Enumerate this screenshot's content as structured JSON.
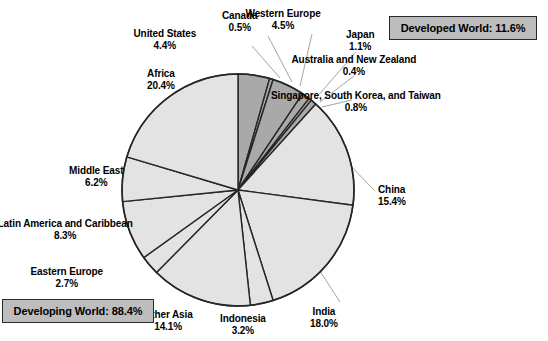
{
  "chart_data": {
    "type": "pie",
    "title": "",
    "subtitle": "",
    "xlabel": "",
    "ylabel": "",
    "legend_position": "none",
    "grid": false,
    "units": "percent",
    "start_angle_deg": 0,
    "direction": "clockwise",
    "total": 100.0,
    "categories": [
      "United States",
      "Canada",
      "Western Europe",
      "Japan",
      "Australia and New Zealand",
      "Singapore, South Korea, and Taiwan",
      "China",
      "India",
      "Indonesia",
      "Other Asia",
      "Eastern Europe",
      "Latin America and Caribbean",
      "Middle East",
      "Africa"
    ],
    "values": [
      4.4,
      0.5,
      4.5,
      1.1,
      0.4,
      0.8,
      15.4,
      18.0,
      3.2,
      14.1,
      2.7,
      8.3,
      6.2,
      20.4
    ],
    "value_labels": [
      "4.4%",
      "0.5%",
      "4.5%",
      "1.1%",
      "0.4%",
      "0.8%",
      "15.4%",
      "18.0%",
      "3.2%",
      "14.1%",
      "2.7%",
      "8.3%",
      "6.2%",
      "20.4%"
    ],
    "groups": [
      "developed",
      "developed",
      "developed",
      "developed",
      "developed",
      "developed",
      "developing",
      "developing",
      "developing",
      "developing",
      "developing",
      "developing",
      "developing",
      "developing"
    ],
    "group_totals": {
      "developed": 11.6,
      "developing": 88.4
    },
    "colors": {
      "developed": "#a9a9a9",
      "developing": "#e3e3e3",
      "slice_border": "#262626",
      "pie_outline": "#262626",
      "leader_line": "#9a9a9a",
      "badge_fill": "#bdbdbd",
      "badge_border": "#2a2a2a",
      "text": "#000000",
      "background": "#ffffff"
    }
  },
  "geometry": {
    "cx": 238,
    "cy": 190,
    "r": 116
  },
  "slices": [
    {
      "name": "United States",
      "value": "4.4%",
      "group": "developed",
      "label_x": 165,
      "label_y": 28,
      "align": "ctr",
      "leader": {
        "x1": 252,
        "y1": 46,
        "x2": 280,
        "y2": 78
      }
    },
    {
      "name": "Canada",
      "value": "0.5%",
      "group": "developed",
      "label_x": 240,
      "label_y": 10,
      "align": "ctr",
      "leader": {
        "x1": 268,
        "y1": 36,
        "x2": 292,
        "y2": 82
      }
    },
    {
      "name": "Western Europe",
      "value": "4.5%",
      "group": "developed",
      "label_x": 283,
      "label_y": 8,
      "align": "ctr",
      "leader": {
        "x1": 312,
        "y1": 34,
        "x2": 300,
        "y2": 86
      }
    },
    {
      "name": "Japan",
      "value": "1.1%",
      "group": "developed",
      "label_x": 360,
      "label_y": 29,
      "align": "ctr",
      "leader": {
        "x1": 356,
        "y1": 52,
        "x2": 316,
        "y2": 98
      }
    },
    {
      "name": "Australia and New Zealand",
      "value": "0.4%",
      "group": "developed",
      "label_x": 354,
      "label_y": 54,
      "align": "ctr",
      "leader": {
        "x1": 354,
        "y1": 76,
        "x2": 320,
        "y2": 102
      }
    },
    {
      "name": "Singapore, South Korea, and Taiwan",
      "value": "0.8%",
      "group": "developed",
      "label_x": 356,
      "label_y": 90,
      "align": "ctr",
      "leader": {
        "x1": 352,
        "y1": 100,
        "x2": 322,
        "y2": 107
      }
    },
    {
      "name": "China",
      "value": "15.4%",
      "group": "developing",
      "label_x": 378,
      "label_y": 184,
      "align": "lft",
      "leader": {
        "x1": 374,
        "y1": 190,
        "x2": 345,
        "y2": 160
      }
    },
    {
      "name": "India",
      "value": "18.0%",
      "group": "developing",
      "label_x": 324,
      "label_y": 306,
      "align": "ctr",
      "leader": {
        "x1": 340,
        "y1": 302,
        "x2": 318,
        "y2": 268
      }
    },
    {
      "name": "Indonesia",
      "value": "3.2%",
      "group": "developing",
      "label_x": 243,
      "label_y": 313,
      "align": "ctr",
      "leader": null
    },
    {
      "name": "Other Asia",
      "value": "14.1%",
      "group": "developing",
      "label_x": 168,
      "label_y": 309,
      "align": "ctr",
      "leader": null
    },
    {
      "name": "Eastern Europe",
      "value": "2.7%",
      "group": "developing",
      "label_x": 67,
      "label_y": 266,
      "align": "ctr",
      "leader": null
    },
    {
      "name": "Latin America and Caribbean",
      "value": "8.3%",
      "group": "developing",
      "label_x": 65,
      "label_y": 218,
      "align": "ctr",
      "leader": null
    },
    {
      "name": "Middle East",
      "value": "6.2%",
      "group": "developing",
      "label_x": 96,
      "label_y": 165,
      "align": "ctr",
      "leader": null
    },
    {
      "name": "Africa",
      "value": "20.4%",
      "group": "developing",
      "label_x": 161,
      "label_y": 68,
      "align": "ctr",
      "leader": null
    }
  ],
  "badges": {
    "developed": {
      "text": "Developed World: 11.6%",
      "x": 389,
      "y": 16,
      "w": 148,
      "h": 24
    },
    "developing": {
      "text": "Developing World: 88.4%",
      "x": 2,
      "y": 299,
      "w": 152,
      "h": 24
    }
  }
}
